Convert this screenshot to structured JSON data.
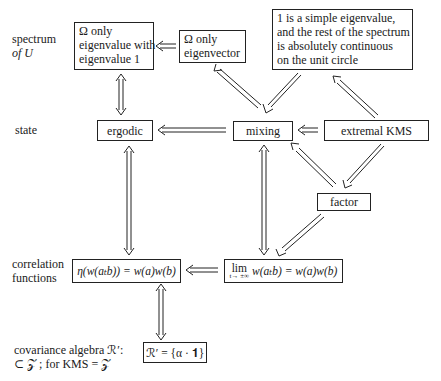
{
  "row_labels": {
    "spectrum": [
      "spectrum",
      "of U"
    ],
    "state": "state",
    "correlation": [
      "correlation",
      "functions"
    ],
    "covariance": [
      "covariance algebra ℛ′:",
      "⊂ 𝒵 ; for KMS = 𝒵"
    ]
  },
  "boxes": {
    "omega_only_eigenvalue": [
      "Ω only",
      "eigenvalue with",
      "eigenvalue 1"
    ],
    "omega_only_eigenvector": [
      "Ω only",
      "eigenvector"
    ],
    "simple_eigenvalue": [
      "1 is a simple eigenvalue,",
      "and the rest of the spectrum",
      "is absolutely continuous",
      "on the unit circle"
    ],
    "ergodic": "ergodic",
    "mixing": "mixing",
    "extremal_kms": "extremal KMS",
    "factor": "factor",
    "eta_correlation": "η(w(aₜb)) = w(a)w(b)",
    "lim_word": "lim",
    "lim_sub": "t→ ±∞",
    "lim_correlation": "w(aₜb) = w(a)w(b)",
    "covariance_trivial": "ℛ′ = {α · 𝟏}"
  },
  "arrows": [
    {
      "from": "omega_only_eigenvector",
      "to": "omega_only_eigenvalue",
      "type": "implies"
    },
    {
      "from": "mixing",
      "to": "omega_only_eigenvector",
      "type": "implies"
    },
    {
      "from": "simple_eigenvalue",
      "to": "mixing",
      "type": "implies"
    },
    {
      "from": "extremal_kms",
      "to": "simple_eigenvalue",
      "type": "implies"
    },
    {
      "from": "omega_only_eigenvalue",
      "to": "ergodic",
      "type": "equivalent"
    },
    {
      "from": "mixing",
      "to": "ergodic",
      "type": "implies"
    },
    {
      "from": "extremal_kms",
      "to": "mixing",
      "type": "implies"
    },
    {
      "from": "extremal_kms",
      "to": "factor",
      "type": "implies"
    },
    {
      "from": "factor",
      "to": "mixing",
      "type": "implies"
    },
    {
      "from": "ergodic",
      "to": "eta_correlation",
      "type": "equivalent"
    },
    {
      "from": "mixing",
      "to": "lim_correlation",
      "type": "equivalent"
    },
    {
      "from": "factor",
      "to": "lim_correlation",
      "type": "implies"
    },
    {
      "from": "lim_correlation",
      "to": "eta_correlation",
      "type": "implies"
    },
    {
      "from": "eta_correlation",
      "to": "covariance_trivial",
      "type": "equivalent"
    }
  ]
}
